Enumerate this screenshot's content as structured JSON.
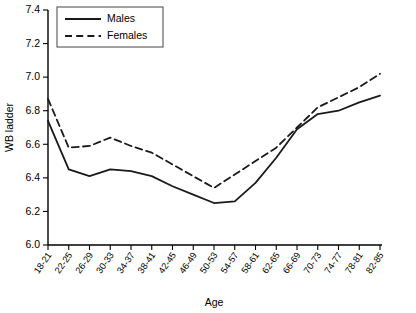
{
  "chart_data": {
    "type": "line",
    "title": "",
    "xlabel": "Age",
    "ylabel": "WB ladder",
    "ylim": [
      6.0,
      7.4
    ],
    "ytick_labels": [
      "6.0",
      "6.2",
      "6.4",
      "6.6",
      "6.8",
      "7.0",
      "7.2",
      "7.4"
    ],
    "ytick_values": [
      6.0,
      6.2,
      6.4,
      6.6,
      6.8,
      7.0,
      7.2,
      7.4
    ],
    "grid": false,
    "legend_position": "top-left",
    "categories": [
      "18-21",
      "22-25",
      "26-29",
      "30-33",
      "34-37",
      "38-41",
      "42-45",
      "46-49",
      "50-53",
      "54-57",
      "58-61",
      "62-65",
      "66-69",
      "70-73",
      "74-77",
      "78-81",
      "82-85"
    ],
    "series": [
      {
        "name": "Males",
        "style": "solid",
        "values": [
          6.74,
          6.45,
          6.41,
          6.45,
          6.44,
          6.41,
          6.35,
          6.3,
          6.25,
          6.26,
          6.37,
          6.52,
          6.69,
          6.78,
          6.8,
          6.85,
          6.89
        ]
      },
      {
        "name": "Females",
        "style": "dashed",
        "values": [
          6.87,
          6.58,
          6.59,
          6.64,
          6.59,
          6.55,
          6.48,
          6.41,
          6.34,
          6.42,
          6.5,
          6.58,
          6.7,
          6.82,
          6.88,
          6.94,
          7.02
        ]
      }
    ]
  },
  "legend": {
    "items": [
      {
        "label": "Males",
        "style": "solid"
      },
      {
        "label": "Females",
        "style": "dashed"
      }
    ]
  }
}
